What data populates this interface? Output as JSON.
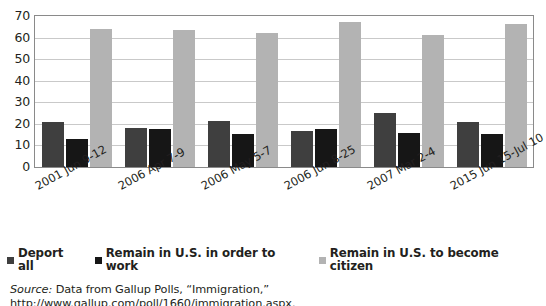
{
  "chart_data": {
    "type": "bar",
    "title": "",
    "subtitle": "",
    "xlabel": "",
    "ylabel": "",
    "ylim": [
      0,
      70
    ],
    "yticks": [
      0,
      10,
      20,
      30,
      40,
      50,
      60,
      70
    ],
    "grid": true,
    "legend_position": "bottom",
    "categories": [
      "2001 Jun 9-12",
      "2006 Apr 7-9",
      "2006 May 5-7",
      "2006 Jun 8-25",
      "2007 Mar 2-4",
      "2015 Jun 15-Jul 10"
    ],
    "series": [
      {
        "name": "Deport all",
        "color": "#3f3f3f",
        "values": [
          21,
          18,
          21.5,
          16.5,
          25,
          21
        ]
      },
      {
        "name": "Remain in U.S. in order to work",
        "color": "#161616",
        "values": [
          13,
          17.5,
          15.5,
          17.5,
          16,
          15.5
        ]
      },
      {
        "name": "Remain in U.S. to become citizen",
        "color": "#b3b3b3",
        "values": [
          64,
          63.5,
          62,
          67,
          61,
          66.5
        ]
      }
    ]
  },
  "legend": {
    "entries": [
      {
        "label": "Deport all",
        "swatch": "s0"
      },
      {
        "label": "Remain in U.S. in order to work",
        "swatch": "s1"
      },
      {
        "label": "Remain in U.S. to become citizen",
        "swatch": "s2"
      }
    ]
  },
  "source": {
    "prefix": "Source:",
    "text": " Data from Gallup Polls, “Immigration,” http://www.gallup.com/poll/1660/immigration.aspx."
  }
}
